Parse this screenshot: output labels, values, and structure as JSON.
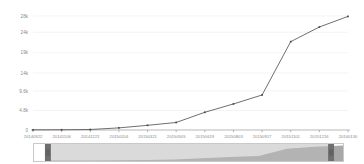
{
  "chart_data": {
    "type": "line",
    "title": "",
    "subtitle": "",
    "xlabel": "",
    "ylabel": "",
    "grid": true,
    "legend": false,
    "ylim": [
      0,
      28000
    ],
    "ytick_labels": [
      "28k",
      "24k",
      "19k",
      "14k",
      "9.6k",
      "4.8k",
      "0"
    ],
    "ytick_values": [
      28000,
      24000,
      19000,
      14000,
      9600,
      4800,
      0
    ],
    "categories": [
      "20140922",
      "20141106",
      "20141221",
      "20150204",
      "20150321",
      "20150505",
      "20150619",
      "20150803",
      "20150917",
      "20151101",
      "20151216",
      "20160130"
    ],
    "series": [
      {
        "name": "cumulative",
        "values": [
          40,
          60,
          120,
          520,
          1150,
          1850,
          4350,
          6400,
          8600,
          21700,
          25300,
          27900
        ]
      }
    ],
    "points": [
      {
        "x": "20140922",
        "y": 40
      },
      {
        "x": "20141106",
        "y": 60
      },
      {
        "x": "20141221",
        "y": 120
      },
      {
        "x": "20150204",
        "y": 520
      },
      {
        "x": "20150321",
        "y": 1150
      },
      {
        "x": "20150505",
        "y": 1850
      },
      {
        "x": "20150619",
        "y": 4350
      },
      {
        "x": "20150803",
        "y": 6400
      },
      {
        "x": "20150917",
        "y": 8600
      },
      {
        "x": "20151101",
        "y": 21700
      },
      {
        "x": "20151216",
        "y": 25300
      },
      {
        "x": "20160130",
        "y": 27900
      }
    ],
    "colors": {
      "line": "#555555",
      "marker": "#4a4a4a",
      "grid": "#ededed",
      "axis": "#9a9a9a",
      "tick_text": "#8a8a8a",
      "background": "#ffffff"
    }
  },
  "navigator": {
    "name": "range-selector",
    "selected_start_label": "20141106",
    "selected_end_label": "20160130",
    "handle_left_name": "left-handle",
    "handle_right_name": "right-handle",
    "colors": {
      "area": "#a8a8a8",
      "selected_mask": "#bcbcbc",
      "handle": "#6e6e6e",
      "border": "#c9c9c9"
    }
  }
}
